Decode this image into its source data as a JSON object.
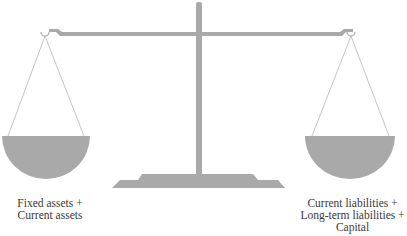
{
  "diagram": {
    "type": "balance-scale",
    "colors": {
      "fill": "#a9a9a9",
      "string": "#b5b5b5",
      "text": "#3a3a3a",
      "background": "#ffffff"
    },
    "left_pan": {
      "label_lines": [
        "Fixed assets +",
        "Current assets"
      ]
    },
    "right_pan": {
      "label_lines": [
        "Current liabilities +",
        "Long-term liabilities +",
        "Capital"
      ]
    }
  }
}
